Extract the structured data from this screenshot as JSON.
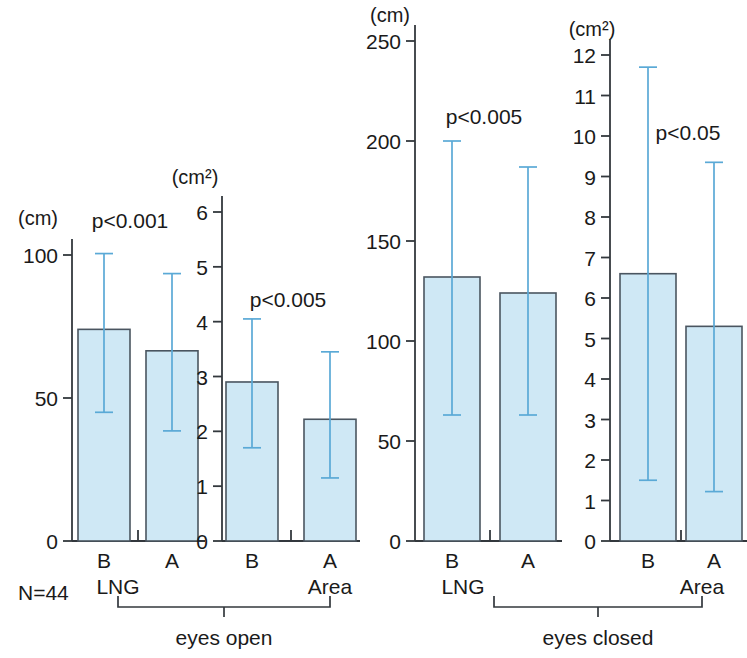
{
  "figure": {
    "sample_size_label": "N=44",
    "conditions": [
      {
        "label": "eyes open"
      },
      {
        "label": "eyes closed"
      }
    ]
  },
  "chart_data": {
    "type": "bar",
    "title": "",
    "xlabel": "",
    "ylabel": "",
    "grid": false,
    "legend": "none",
    "categories": [
      "B",
      "A"
    ],
    "annotations": [
      "N=44",
      "eyes open",
      "eyes closed"
    ],
    "panels": [
      {
        "id": "lng-eyes-open",
        "measure": "LNG",
        "condition": "eyes open",
        "unit": "(cm)",
        "ylim": [
          0,
          110
        ],
        "ticks": [
          0,
          50,
          100
        ],
        "tick_labels": [
          "0",
          "50",
          "100"
        ],
        "p_value": "p<0.001",
        "categories": [
          "B",
          "A"
        ],
        "values": [
          74,
          66.5
        ],
        "err_high": [
          100.5,
          93.5
        ],
        "err_low": [
          45.0,
          38.5
        ]
      },
      {
        "id": "area-eyes-open",
        "measure": "Area",
        "condition": "eyes open",
        "unit": "(cm²)",
        "ylim": [
          0,
          6.6
        ],
        "ticks": [
          0,
          1,
          2,
          3,
          4,
          5,
          6
        ],
        "tick_labels": [
          "0",
          "1",
          "2",
          "3",
          "4",
          "5",
          "6"
        ],
        "p_value": "p<0.005",
        "categories": [
          "B",
          "A"
        ],
        "values": [
          2.9,
          2.22
        ],
        "err_high": [
          4.05,
          3.45
        ],
        "err_low": [
          1.7,
          1.15
        ]
      },
      {
        "id": "lng-eyes-closed",
        "measure": "LNG",
        "condition": "eyes closed",
        "unit": "(cm)",
        "ylim": [
          0,
          272
        ],
        "ticks": [
          0,
          50,
          100,
          150,
          200,
          250
        ],
        "tick_labels": [
          "0",
          "50",
          "100",
          "150",
          "200",
          "250"
        ],
        "p_value": "p<0.005",
        "categories": [
          "B",
          "A"
        ],
        "values": [
          132,
          124
        ],
        "err_high": [
          200,
          187
        ],
        "err_low": [
          63,
          63
        ]
      },
      {
        "id": "area-eyes-closed",
        "measure": "Area",
        "condition": "eyes closed",
        "unit": "(cm²)",
        "ylim": [
          0,
          13.1
        ],
        "ticks": [
          0,
          1,
          2,
          3,
          4,
          5,
          6,
          7,
          8,
          9,
          10,
          11,
          12
        ],
        "tick_labels": [
          "0",
          "1",
          "2",
          "3",
          "4",
          "5",
          "6",
          "7",
          "8",
          "9",
          "10",
          "11",
          "12"
        ],
        "p_value": "p<0.05",
        "categories": [
          "B",
          "A"
        ],
        "values": [
          6.6,
          5.3
        ],
        "err_high": [
          11.7,
          9.35
        ],
        "err_low": [
          1.5,
          1.22
        ]
      }
    ]
  },
  "colors": {
    "bar_fill": "#cfe8f5",
    "bar_stroke": "#4a5560",
    "error_bar": "#5aa9d6",
    "axis": "#33383d",
    "text": "#1a1a1a"
  }
}
